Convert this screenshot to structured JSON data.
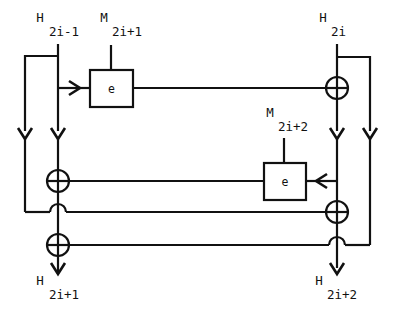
{
  "diagram": {
    "type": "block-cipher-dataflow",
    "stroke_color": "#111111",
    "background_color": "#ffffff",
    "labels": {
      "h_in_left": {
        "symbol": "H",
        "subscript": "2i-1"
      },
      "h_in_right": {
        "symbol": "H",
        "subscript": "2i"
      },
      "m_top": {
        "symbol": "M",
        "subscript": "2i+1"
      },
      "m_mid": {
        "symbol": "M",
        "subscript": "2i+2"
      },
      "h_out_left": {
        "symbol": "H",
        "subscript": "2i+1"
      },
      "h_out_right": {
        "symbol": "H",
        "subscript": "2i+2"
      }
    },
    "blocks": [
      {
        "name": "encrypt-block-top",
        "label": "e"
      },
      {
        "name": "encrypt-block-middle",
        "label": "e"
      }
    ],
    "xor_gates": [
      {
        "name": "xor-top-right"
      },
      {
        "name": "xor-left-upper"
      },
      {
        "name": "xor-left-lower"
      },
      {
        "name": "xor-right-middle"
      }
    ]
  }
}
